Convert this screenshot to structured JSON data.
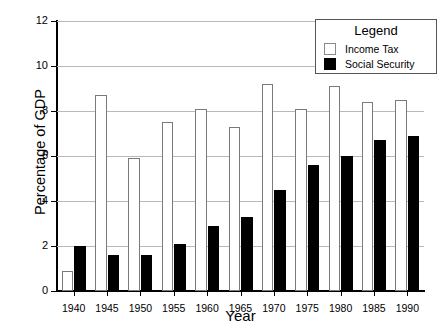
{
  "chart_data": {
    "type": "bar",
    "title": "",
    "xlabel": "Year",
    "ylabel": "Percentage of GDP",
    "categories": [
      "1940",
      "1945",
      "1950",
      "1955",
      "1960",
      "1965",
      "1970",
      "1975",
      "1980",
      "1985",
      "1990"
    ],
    "series": [
      {
        "name": "Income Tax",
        "color": "#ffffff",
        "edge_color": "#7a7a7a",
        "values": [
          0.9,
          8.7,
          5.9,
          7.5,
          8.1,
          7.3,
          9.2,
          8.1,
          9.1,
          8.4,
          8.5
        ]
      },
      {
        "name": "Social Security",
        "color": "#000000",
        "edge_color": "#000000",
        "values": [
          2.0,
          1.6,
          1.6,
          2.1,
          2.9,
          3.3,
          4.5,
          5.6,
          6.0,
          6.7,
          6.9
        ]
      }
    ],
    "ylim": [
      0,
      12
    ],
    "yticks": [
      0,
      2,
      4,
      6,
      8,
      10,
      12
    ],
    "ytick_labels": [
      "0",
      "2",
      "4",
      "6",
      "8",
      "10",
      "12"
    ],
    "grid": true,
    "grid_axis": "y",
    "legend_position": "upper right"
  },
  "legend": {
    "title": "Legend",
    "entries": [
      {
        "label": "Income Tax",
        "swatch": "income-tax-swatch"
      },
      {
        "label": "Social Security",
        "swatch": "social-security-swatch"
      }
    ]
  }
}
